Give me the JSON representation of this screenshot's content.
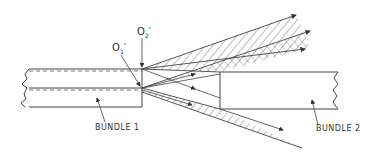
{
  "diagram": {
    "labels": {
      "bundle1": "BUNDLE 1",
      "bundle2": "BUNDLE 2",
      "o1": "O",
      "o1_sub": "1",
      "o1_prime": "′",
      "o2": "O",
      "o2_sub": "2",
      "o2_prime": "′"
    },
    "colors": {
      "line": "#444444",
      "background": "#ffffff"
    }
  }
}
